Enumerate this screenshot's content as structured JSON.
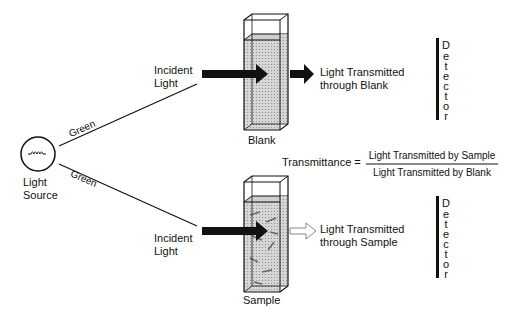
{
  "diagram": {
    "source": {
      "label_line1": "Light",
      "label_line2": "Source"
    },
    "beams": {
      "top_color_label": "Green",
      "bottom_color_label": "Green"
    },
    "blank_path": {
      "incident_line1": "Incident",
      "incident_line2": "Light",
      "cuvette_label": "Blank",
      "transmitted_line1": "Light Transmitted",
      "transmitted_line2": "through Blank",
      "detector_letters": [
        "D",
        "e",
        "t",
        "e",
        "c",
        "t",
        "o",
        "r"
      ]
    },
    "sample_path": {
      "incident_line1": "Incident",
      "incident_line2": "Light",
      "cuvette_label": "Sample",
      "transmitted_line1": "Light Transmitted",
      "transmitted_line2": "through Sample",
      "detector_letters": [
        "D",
        "e",
        "t",
        "e",
        "c",
        "t",
        "o",
        "r"
      ]
    },
    "equation": {
      "lhs": "Transmittance =",
      "numerator": "Light Transmitted by Sample",
      "denominator": "Light Transmitted by Blank"
    }
  }
}
